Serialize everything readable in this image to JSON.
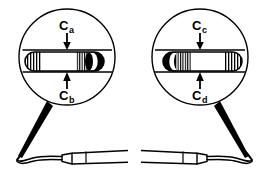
{
  "figure": {
    "background_color": "#ffffff",
    "line_color": "#000000",
    "width": 269,
    "height": 176
  },
  "insets": [
    {
      "id": "left-inset",
      "name": "left-magnifier",
      "center_x": 67,
      "center_y": 57,
      "radius": 48,
      "orientation": "tip-right",
      "labels": [
        {
          "id": "label-ca",
          "base": "C",
          "subscript": "a",
          "full": "Ca",
          "position": "top",
          "arrow_direction": "down",
          "x": 67,
          "y": 28
        },
        {
          "id": "label-cb",
          "base": "C",
          "subscript": "b",
          "full": "Cb",
          "position": "bottom",
          "arrow_direction": "up",
          "x": 67,
          "y": 96
        }
      ],
      "band": {
        "name": "horizontal-band",
        "top_y": 50,
        "bottom_y": 72
      },
      "blade": {
        "name": "blade-cross-section",
        "left_x": 25,
        "right_x": 104,
        "top_y": 52,
        "bottom_y": 71,
        "hatch_groups": 2,
        "solid_cap_side": "right"
      }
    },
    {
      "id": "right-inset",
      "name": "right-magnifier",
      "center_x": 200,
      "center_y": 57,
      "radius": 48,
      "orientation": "tip-left",
      "labels": [
        {
          "id": "label-cc",
          "base": "C",
          "subscript": "c",
          "full": "Cc",
          "position": "top",
          "arrow_direction": "down",
          "x": 200,
          "y": 28
        },
        {
          "id": "label-cd",
          "base": "C",
          "subscript": "d",
          "full": "Cd",
          "position": "bottom",
          "arrow_direction": "up",
          "x": 200,
          "y": 96
        }
      ],
      "band": {
        "name": "horizontal-band",
        "top_y": 50,
        "bottom_y": 72
      },
      "blade": {
        "name": "blade-cross-section",
        "left_x": 163,
        "right_x": 242,
        "top_y": 52,
        "bottom_y": 71,
        "hatch_groups": 2,
        "solid_cap_side": "left"
      }
    }
  ],
  "instruments": [
    {
      "id": "left-instrument",
      "name": "dental-scaler-left",
      "tip_side": "left",
      "handle_side": "right",
      "baseline_y": 160
    },
    {
      "id": "right-instrument",
      "name": "dental-scaler-right",
      "tip_side": "right",
      "handle_side": "left",
      "baseline_y": 160
    }
  ],
  "leaders": [
    {
      "id": "left-leader",
      "name": "leader-wedge-left",
      "from": "left-magnifier-bottom",
      "to": "left-instrument-tip"
    },
    {
      "id": "right-leader",
      "name": "leader-wedge-right",
      "from": "right-magnifier-bottom",
      "to": "right-instrument-tip"
    }
  ]
}
